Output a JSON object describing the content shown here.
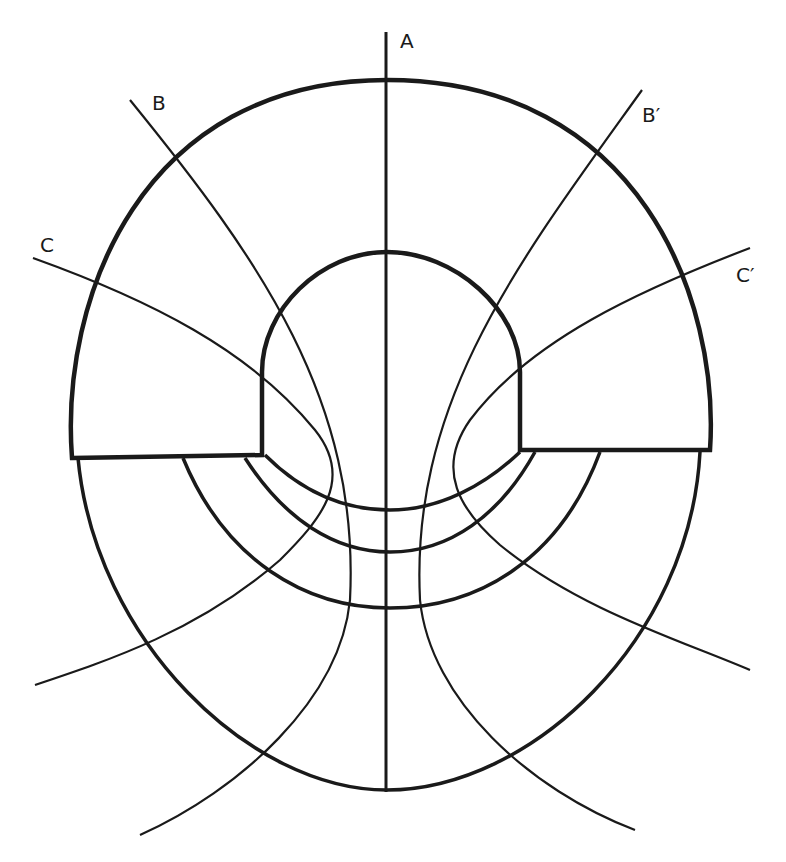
{
  "diagram": {
    "labels": {
      "A": "A",
      "B": "B",
      "B_prime": "B′",
      "C": "C",
      "C_prime": "C′"
    },
    "colors": {
      "stroke": "#1a1a1a",
      "background": "#ffffff"
    }
  }
}
